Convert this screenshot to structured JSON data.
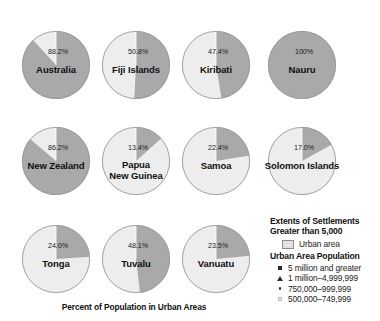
{
  "chart_data": {
    "type": "pie",
    "title": "Percent of Population in Urban Areas",
    "series_name": "Urban area",
    "value_suffix": "%",
    "categories": [
      "Australia",
      "Fiji Islands",
      "Kiribati",
      "Nauru",
      "New Zealand",
      "Papua New Guinea",
      "Samoa",
      "Solomon Islands",
      "Tonga",
      "Tuvalu",
      "Vanuatu"
    ],
    "values": [
      88.2,
      50.8,
      47.4,
      100,
      86.2,
      13.4,
      22.4,
      17.0,
      24.0,
      48.1,
      23.5
    ],
    "pies": [
      {
        "name": "Australia",
        "label_lines": [
          "Australia"
        ],
        "value": 88.2,
        "value_label": "88.2%",
        "cx": 56,
        "cy": 65,
        "r": 34
      },
      {
        "name": "Fiji Islands",
        "label_lines": [
          "Fiji Islands"
        ],
        "value": 50.8,
        "value_label": "50.8%",
        "cx": 136,
        "cy": 65,
        "r": 34
      },
      {
        "name": "Kiribati",
        "label_lines": [
          "Kiribati"
        ],
        "value": 47.4,
        "value_label": "47.4%",
        "cx": 216,
        "cy": 65,
        "r": 34
      },
      {
        "name": "Nauru",
        "label_lines": [
          "Nauru"
        ],
        "value": 100,
        "value_label": "100%",
        "cx": 302,
        "cy": 65,
        "r": 34
      },
      {
        "name": "New Zealand",
        "label_lines": [
          "New Zealand"
        ],
        "value": 86.2,
        "value_label": "86.2%",
        "cx": 56,
        "cy": 161,
        "r": 34
      },
      {
        "name": "Papua New Guinea",
        "label_lines": [
          "Papua",
          "New Guinea"
        ],
        "value": 13.4,
        "value_label": "13.4%",
        "cx": 136,
        "cy": 161,
        "r": 34
      },
      {
        "name": "Samoa",
        "label_lines": [
          "Samoa"
        ],
        "value": 22.4,
        "value_label": "22.4%",
        "cx": 216,
        "cy": 161,
        "r": 34
      },
      {
        "name": "Solomon Islands",
        "label_lines": [
          "Solomon Islands"
        ],
        "value": 17.0,
        "value_label": "17.0%",
        "cx": 302,
        "cy": 161,
        "r": 34
      },
      {
        "name": "Tonga",
        "label_lines": [
          "Tonga"
        ],
        "value": 24.0,
        "value_label": "24.0%",
        "cx": 56,
        "cy": 259,
        "r": 34
      },
      {
        "name": "Tuvalu",
        "label_lines": [
          "Tuvalu"
        ],
        "value": 48.1,
        "value_label": "48.1%",
        "cx": 136,
        "cy": 259,
        "r": 34
      },
      {
        "name": "Vanuatu",
        "label_lines": [
          "Vanuatu"
        ],
        "value": 23.5,
        "value_label": "23.5%",
        "cx": 216,
        "cy": 259,
        "r": 34
      }
    ],
    "colors": {
      "urban_slice": "#a9a9a9",
      "rural_slice": "#ededed",
      "slice_outline": "#9a9a9a",
      "text": "#111111",
      "background": "#ffffff"
    },
    "legend_position": "bottom-right"
  },
  "legend": {
    "heading_line1": "Extents of Settlements",
    "heading_line2": "Greater than 5,000",
    "urban_area_label": "Urban area",
    "population_heading": "Urban Area Population",
    "population_classes": [
      {
        "symbol": "filled-square",
        "label": "5 million and greater"
      },
      {
        "symbol": "filled-triangle",
        "label": "1 million–4,999,999"
      },
      {
        "symbol": "filled-dot",
        "label": "750,000–999,999"
      },
      {
        "symbol": "open-circle",
        "label": "500,000–749,999"
      }
    ]
  }
}
